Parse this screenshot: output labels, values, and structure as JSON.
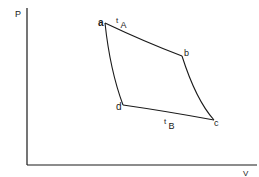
{
  "diagram": {
    "type": "pv-cycle",
    "axes": {
      "y_label": "P",
      "x_label": "V"
    },
    "points": {
      "a": "a",
      "b": "b",
      "c": "c",
      "d": "d"
    },
    "isotherm_labels": {
      "top": {
        "main": "t",
        "sub": "A"
      },
      "bottom": {
        "main": "t",
        "sub": "B"
      }
    },
    "colors": {
      "line": "#1a1a1a",
      "background": "#ffffff"
    }
  }
}
